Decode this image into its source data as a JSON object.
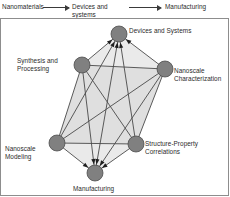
{
  "figure": {
    "top_flow": {
      "items": [
        {
          "label": "Nanomaterials"
        },
        {
          "label": "Devices and\nsystems"
        },
        {
          "label": "Manufacturing"
        }
      ],
      "arrows": [
        {
          "name": "arrow-nanomaterials-to-devices"
        },
        {
          "name": "arrow-devices-to-manufacturing"
        }
      ]
    },
    "diagram": {
      "type": "node-link-graph",
      "node_color": "#808080",
      "node_stroke": "#4d4d4d",
      "edge_color": "#4a4a4a",
      "face_fill": "#e3e3e3",
      "nodes": [
        {
          "id": "devices",
          "label": "Devices and Systems",
          "cx": 118,
          "cy": 15,
          "r": 8
        },
        {
          "id": "synthesis",
          "label": "Synthesis and\nProcessing",
          "cx": 81,
          "cy": 46,
          "r": 8
        },
        {
          "id": "charact",
          "label": "Nanoscale\nCharacterization",
          "cx": 164,
          "cy": 50,
          "r": 8
        },
        {
          "id": "modeling",
          "label": "Nanoscale\nModeling",
          "cx": 56,
          "cy": 124,
          "r": 8
        },
        {
          "id": "structure",
          "label": "Structure-Property\nCorrelations",
          "cx": 135,
          "cy": 125,
          "r": 8
        },
        {
          "id": "manufact",
          "label": "Manufacturing",
          "cx": 94,
          "cy": 154,
          "r": 8
        }
      ],
      "edges": [
        {
          "from": "devices",
          "to": "synthesis"
        },
        {
          "from": "devices",
          "to": "charact"
        },
        {
          "from": "devices",
          "to": "modeling"
        },
        {
          "from": "devices",
          "to": "structure"
        },
        {
          "from": "devices",
          "to": "manufact"
        },
        {
          "from": "synthesis",
          "to": "charact"
        },
        {
          "from": "synthesis",
          "to": "modeling"
        },
        {
          "from": "synthesis",
          "to": "structure"
        },
        {
          "from": "synthesis",
          "to": "manufact"
        },
        {
          "from": "charact",
          "to": "modeling"
        },
        {
          "from": "charact",
          "to": "structure"
        },
        {
          "from": "charact",
          "to": "manufact"
        },
        {
          "from": "modeling",
          "to": "structure"
        },
        {
          "from": "modeling",
          "to": "manufact"
        },
        {
          "from": "structure",
          "to": "manufact"
        }
      ]
    }
  }
}
